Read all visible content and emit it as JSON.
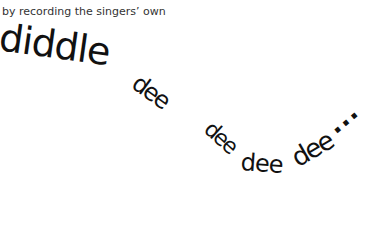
{
  "caption": "by recording the singers’ own",
  "handwriting": {
    "words": [
      {
        "text": "diddle"
      },
      {
        "text": "dee"
      },
      {
        "text": "dee"
      },
      {
        "text": "dee"
      },
      {
        "text": "dee"
      }
    ],
    "ellipsis": "..."
  }
}
